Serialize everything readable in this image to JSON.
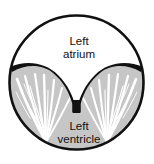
{
  "figure": {
    "kind": "anatomical-cross-section-diagram",
    "background_color": "#ffffff",
    "outline_color": "#111111",
    "atrium_fill": "#ffffff",
    "ventricle_fill": "#c6c6c6",
    "valve_color": "#111111",
    "chordae_color": "#ffffff"
  },
  "labels": {
    "atrium_line1": "Left",
    "atrium_line2": "atrium",
    "ventricle_line1": "Left",
    "ventricle_line2": "ventricle"
  }
}
